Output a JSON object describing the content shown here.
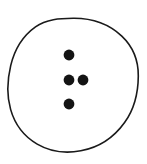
{
  "figure": {
    "title": "Four-hole button outline drawing",
    "canvas": {
      "width": 147,
      "height": 164,
      "background_color": "#ffffff"
    },
    "outline_circle": {
      "name": "button-outline",
      "center_x": 73,
      "center_y": 85,
      "radius_x": 65,
      "radius_y": 67,
      "stroke_color": "#1a1a1a",
      "stroke_width": 1.6,
      "fill_color": "#ffffff"
    },
    "dots": [
      {
        "id": "dot-top",
        "label": "Top hole",
        "cx": 69,
        "cy": 55,
        "r": 5.4,
        "color": "#141414"
      },
      {
        "id": "dot-middle-left",
        "label": "Middle left hole",
        "cx": 69,
        "cy": 80,
        "r": 5.4,
        "color": "#141414"
      },
      {
        "id": "dot-middle-right",
        "label": "Middle right hole",
        "cx": 83,
        "cy": 80,
        "r": 5.4,
        "color": "#141414"
      },
      {
        "id": "dot-bottom",
        "label": "Bottom hole",
        "cx": 69,
        "cy": 104,
        "r": 5.4,
        "color": "#141414"
      }
    ]
  }
}
